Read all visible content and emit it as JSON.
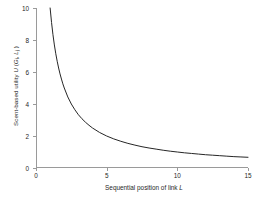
{
  "chart_data": {
    "type": "line",
    "title": "",
    "subtitle": "",
    "xlabel": "Sequential position of link L",
    "ylabel": "Scent-based utility U (G , L )",
    "xlabel_parts": {
      "text": "Sequential position of link ",
      "italic": "L"
    },
    "ylabel_parts": {
      "text": "Scent-based utility ",
      "italic_u": "U",
      "paren_open": " (",
      "italic_g": "G",
      "sub_g": "i",
      "comma": ", ",
      "italic_l": "L",
      "sub_l": "j",
      "paren_close": " )"
    },
    "xlim": [
      0,
      15
    ],
    "ylim": [
      0,
      10
    ],
    "xticks": [
      0,
      5,
      10,
      15
    ],
    "yticks": [
      0,
      2,
      4,
      6,
      8,
      10
    ],
    "grid": false,
    "legend": false,
    "legend_position": "none",
    "line_color": "#262626",
    "line_width": 1,
    "axis_color": "#9a9a9a",
    "background": "#ffffff",
    "equation": "U = 10 / L",
    "series": [
      {
        "name": "Scent-based utility",
        "x": [
          1.0,
          1.1,
          1.2,
          1.3,
          1.4,
          1.5,
          1.6,
          1.7,
          1.8,
          1.9,
          2.0,
          2.25,
          2.5,
          2.75,
          3.0,
          3.25,
          3.5,
          3.75,
          4.0,
          4.5,
          5.0,
          5.5,
          6.0,
          6.5,
          7.0,
          7.5,
          8.0,
          8.5,
          9.0,
          9.5,
          10.0,
          10.5,
          11.0,
          11.5,
          12.0,
          12.5,
          13.0,
          13.5,
          14.0,
          14.5,
          15.0
        ],
        "y": [
          10.0,
          9.09,
          8.33,
          7.69,
          7.14,
          6.67,
          6.25,
          5.88,
          5.56,
          5.26,
          5.0,
          4.44,
          4.0,
          3.64,
          3.33,
          3.08,
          2.86,
          2.67,
          2.5,
          2.22,
          2.0,
          1.82,
          1.67,
          1.54,
          1.43,
          1.33,
          1.25,
          1.18,
          1.11,
          1.05,
          1.0,
          0.95,
          0.91,
          0.87,
          0.83,
          0.8,
          0.77,
          0.74,
          0.71,
          0.69,
          0.67
        ]
      }
    ]
  }
}
